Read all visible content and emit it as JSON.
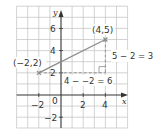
{
  "diagram": {
    "type": "coordinate-grid",
    "grid": {
      "x_min": -4,
      "x_max": 6,
      "y_min": -3,
      "y_max": 8,
      "step": 1
    },
    "axes": {
      "x_label": "x",
      "y_label": "y",
      "x_ticks": [
        {
          "value": -2,
          "label": "−2"
        },
        {
          "value": 2,
          "label": "2"
        },
        {
          "value": 4,
          "label": "4"
        }
      ],
      "y_ticks": [
        {
          "value": 6,
          "label": "6"
        },
        {
          "value": 4,
          "label": "4"
        },
        {
          "value": 2,
          "label": "2"
        },
        {
          "value": -2,
          "label": "−2"
        }
      ],
      "origin_label": "0"
    },
    "points": [
      {
        "x": -2,
        "y": 2,
        "label": "(−2,2)"
      },
      {
        "x": 4,
        "y": 5,
        "label": "(4,5)"
      }
    ],
    "annotations": {
      "horizontal_run": "4 − −2 = 6",
      "vertical_rise": "5 − 2 = 3"
    },
    "colors": {
      "grid": "#c8c8c8",
      "axis": "#333333",
      "segment": "#8c8c8c",
      "dashed": "#8c8c8c",
      "text": "#333333"
    }
  }
}
